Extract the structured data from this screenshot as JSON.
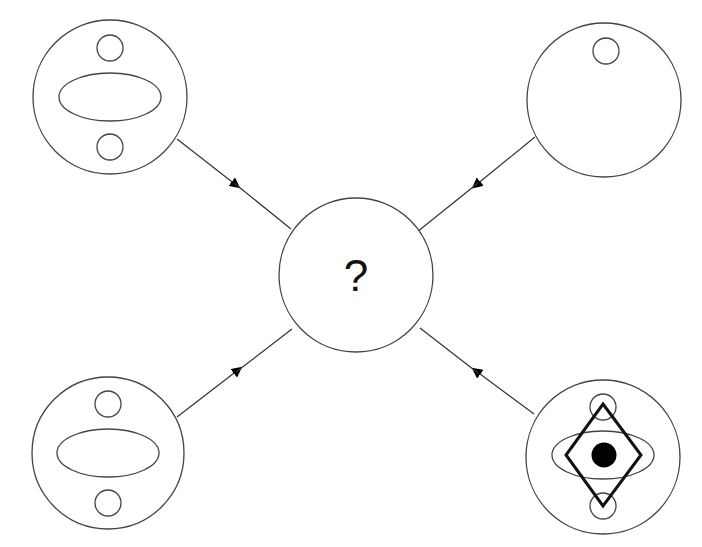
{
  "diagram": {
    "center_label": "?",
    "colors": {
      "stroke": "#444444",
      "fill_dot": "#000000",
      "diamond": "#111111"
    },
    "nodes": [
      {
        "id": "top-left",
        "contents": [
          "small-circle-top",
          "ellipse",
          "small-circle-bottom"
        ]
      },
      {
        "id": "top-right",
        "contents": [
          "small-circle-top"
        ]
      },
      {
        "id": "bottom-left",
        "contents": [
          "small-circle-top",
          "ellipse",
          "small-circle-bottom"
        ]
      },
      {
        "id": "bottom-right",
        "contents": [
          "small-circle-top",
          "ellipse",
          "small-circle-bottom",
          "diamond",
          "filled-dot"
        ]
      }
    ],
    "edges": [
      {
        "from": "top-left",
        "to": "center"
      },
      {
        "from": "top-right",
        "to": "center"
      },
      {
        "from": "bottom-left",
        "to": "center"
      },
      {
        "from": "bottom-right",
        "to": "center"
      }
    ]
  }
}
